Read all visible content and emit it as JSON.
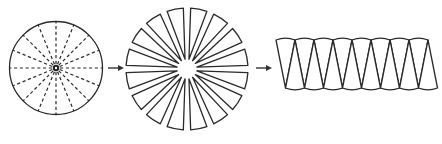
{
  "diagram": {
    "title": "",
    "stages": [
      {
        "id": "circle",
        "label": "",
        "kind": "circle-with-dashed-radii",
        "sector_count": 16,
        "center_marker": "filled-dot"
      },
      {
        "id": "exploded",
        "label": "",
        "kind": "exploded-sectors",
        "sector_count": 16
      },
      {
        "id": "rearranged",
        "label": "",
        "kind": "alternating-sector-strip",
        "sectors_up": 8,
        "sectors_down": 8
      }
    ],
    "arrows": [
      {
        "from": "circle",
        "to": "exploded",
        "direction": "right"
      },
      {
        "from": "exploded",
        "to": "rearranged",
        "direction": "right"
      }
    ],
    "colors": {
      "stroke": "#2a2a2a",
      "background": "#ffffff"
    }
  }
}
